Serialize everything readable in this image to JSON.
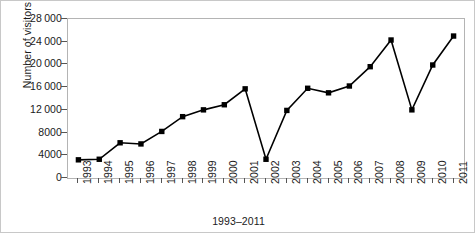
{
  "chart_data": {
    "type": "line",
    "title": "",
    "subtitle": "",
    "xlabel": "1993–2011",
    "ylabel": "Number of visitors",
    "categories": [
      "1993",
      "1994",
      "1995",
      "1996",
      "1997",
      "1998",
      "1999",
      "2000",
      "2001",
      "2002",
      "2003",
      "2004",
      "2005",
      "2006",
      "2007",
      "2008",
      "2009",
      "2010",
      "2011"
    ],
    "values": [
      3200,
      3300,
      6200,
      6000,
      8200,
      10800,
      12000,
      12900,
      15700,
      3300,
      11900,
      15800,
      15000,
      16200,
      19600,
      24300,
      12000,
      19900,
      25000
    ],
    "series": [
      {
        "name": "Number of visitors",
        "values": [
          3200,
          3300,
          6200,
          6000,
          8200,
          10800,
          12000,
          12900,
          15700,
          3300,
          11900,
          15800,
          15000,
          16200,
          19600,
          24300,
          12000,
          19900,
          25000
        ],
        "color": "#000000",
        "marker": "square"
      }
    ],
    "ylim": [
      0,
      28000
    ],
    "yticks": [
      0,
      4000,
      8000,
      12000,
      16000,
      20000,
      24000,
      28000
    ],
    "ytick_labels": [
      "0",
      "4000",
      "8000",
      "12 000",
      "16 000",
      "20 000",
      "24 000",
      "28 000"
    ],
    "xtick_labels": [
      "1993",
      "1994",
      "1995",
      "1996",
      "1997",
      "1998",
      "1999",
      "2000",
      "2001",
      "2002",
      "2003",
      "2004",
      "2005",
      "2006",
      "2007",
      "2008",
      "2009",
      "2010",
      "2011"
    ],
    "xtick_rotation": 90,
    "grid": false,
    "legend": false,
    "legend_position": "none",
    "line_color": "#000000",
    "marker_color": "#000000",
    "frame_color": "#b4b4b4",
    "background": "#ffffff"
  }
}
